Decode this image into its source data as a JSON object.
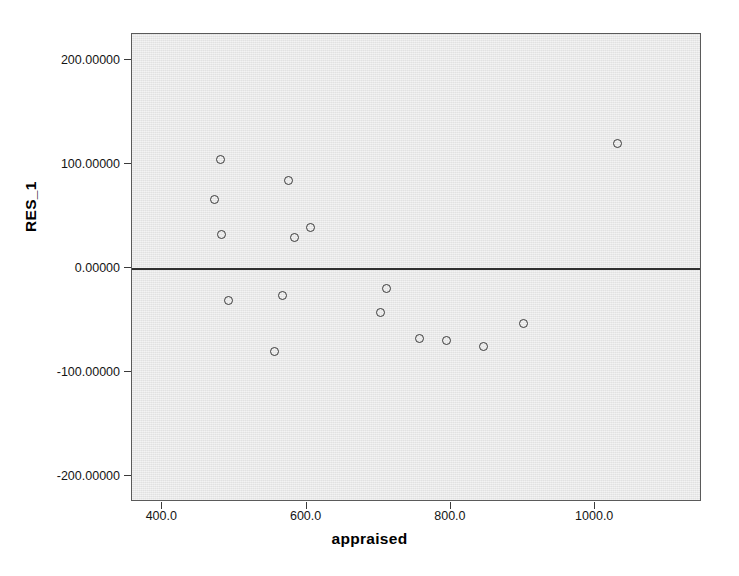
{
  "chart_data": {
    "type": "scatter",
    "title": "",
    "xlabel": "appraised",
    "ylabel": "RES_1",
    "xlim": [
      358,
      1148
    ],
    "ylim": [
      -225,
      225
    ],
    "grid": false,
    "legend": "none",
    "reference_line": {
      "axis": "y",
      "value": 0,
      "label": "0.00000"
    },
    "xticks": [
      400,
      600,
      800,
      1000
    ],
    "xtick_labels": [
      "400.0",
      "600.0",
      "800.0",
      "1000.0"
    ],
    "yticks": [
      200,
      100,
      0,
      -100,
      -200
    ],
    "ytick_labels": [
      "200.00000",
      "100.00000",
      "0.00000",
      "-100.00000",
      "-200.00000"
    ],
    "marker": {
      "shape": "circle",
      "filled": false,
      "edge_color": "#3b3b3b",
      "size": 9
    },
    "plot_background": "#e6e6e6",
    "points": [
      {
        "x": 1031,
        "y": 120
      },
      {
        "x": 481,
        "y": 104
      },
      {
        "x": 575,
        "y": 84
      },
      {
        "x": 472,
        "y": 66
      },
      {
        "x": 605,
        "y": 39
      },
      {
        "x": 482,
        "y": 32
      },
      {
        "x": 583,
        "y": 29
      },
      {
        "x": 711,
        "y": -20
      },
      {
        "x": 567,
        "y": -26
      },
      {
        "x": 492,
        "y": -31
      },
      {
        "x": 702,
        "y": -43
      },
      {
        "x": 900,
        "y": -53
      },
      {
        "x": 757,
        "y": -68
      },
      {
        "x": 794,
        "y": -70
      },
      {
        "x": 845,
        "y": -75
      },
      {
        "x": 556,
        "y": -80
      }
    ]
  }
}
